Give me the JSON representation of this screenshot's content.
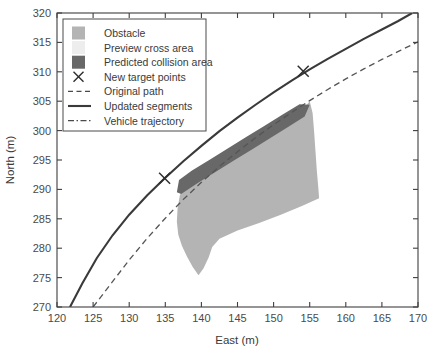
{
  "chart_data": {
    "type": "scatter",
    "title": "",
    "xlabel": "East (m)",
    "ylabel": "North (m)",
    "xlim": [
      120,
      170
    ],
    "ylim": [
      270,
      320
    ],
    "xticks": [
      120,
      125,
      130,
      135,
      140,
      145,
      150,
      155,
      160,
      165,
      170
    ],
    "yticks": [
      270,
      275,
      280,
      285,
      290,
      295,
      300,
      305,
      310,
      315,
      320
    ],
    "grid": false,
    "legend_position": "upper-left",
    "legend": [
      {
        "label": "Obstacle",
        "type": "patch",
        "color": "#b4b4b4"
      },
      {
        "label": "Preview cross area",
        "type": "patch",
        "color": "#ededed"
      },
      {
        "label": "Predicted collision area",
        "type": "patch",
        "color": "#686868"
      },
      {
        "label": "New target points",
        "type": "marker",
        "marker": "x",
        "color": "#2e2e2e"
      },
      {
        "label": "Original path",
        "type": "line",
        "style": "dashed",
        "color": "#4a4a4a"
      },
      {
        "label": "Updated segments",
        "type": "line",
        "style": "solid",
        "color": "#3a3a3a"
      },
      {
        "label": "Vehicle trajectory",
        "type": "line",
        "style": "dashdot",
        "color": "#4a4a4a"
      }
    ],
    "series": [
      {
        "name": "Obstacle",
        "type": "polygon",
        "color": "#b4b4b4",
        "points": [
          [
            137.0,
            288.9
          ],
          [
            137.6,
            290.8
          ],
          [
            139.2,
            292.6
          ],
          [
            141.0,
            294.1
          ],
          [
            143.3,
            295.8
          ],
          [
            145.6,
            297.4
          ],
          [
            148.0,
            299.0
          ],
          [
            150.3,
            300.7
          ],
          [
            152.6,
            302.4
          ],
          [
            154.2,
            303.8
          ],
          [
            155.0,
            305.0
          ],
          [
            155.4,
            303.0
          ],
          [
            155.6,
            300.0
          ],
          [
            155.8,
            296.5
          ],
          [
            156.0,
            293.0
          ],
          [
            156.2,
            290.2
          ],
          [
            156.3,
            288.5
          ],
          [
            154.0,
            287.2
          ],
          [
            151.0,
            285.7
          ],
          [
            148.0,
            284.3
          ],
          [
            145.0,
            283.0
          ],
          [
            142.5,
            281.6
          ],
          [
            141.5,
            280.2
          ],
          [
            141.0,
            278.4
          ],
          [
            140.3,
            276.6
          ],
          [
            139.6,
            275.4
          ],
          [
            138.8,
            276.8
          ],
          [
            138.0,
            278.6
          ],
          [
            137.3,
            280.4
          ],
          [
            136.8,
            282.3
          ],
          [
            136.6,
            284.5
          ],
          [
            136.7,
            286.7
          ]
        ]
      },
      {
        "name": "Predicted collision area",
        "type": "polygon",
        "color": "#686868",
        "points": [
          [
            137.2,
            289.2
          ],
          [
            139.5,
            291.1
          ],
          [
            142.0,
            293.0
          ],
          [
            144.5,
            294.9
          ],
          [
            147.0,
            296.8
          ],
          [
            149.5,
            298.7
          ],
          [
            152.0,
            300.6
          ],
          [
            154.3,
            302.4
          ],
          [
            155.0,
            304.4
          ],
          [
            153.6,
            304.5
          ],
          [
            151.2,
            302.7
          ],
          [
            148.7,
            300.8
          ],
          [
            146.2,
            298.9
          ],
          [
            143.7,
            297.0
          ],
          [
            141.2,
            295.1
          ],
          [
            138.7,
            293.2
          ],
          [
            136.9,
            291.6
          ],
          [
            136.6,
            289.5
          ]
        ]
      },
      {
        "name": "Original path",
        "type": "line",
        "style": "dashed",
        "color": "#555555",
        "points": [
          [
            125.0,
            270.0
          ],
          [
            127.5,
            274.0
          ],
          [
            130.0,
            278.0
          ],
          [
            132.5,
            281.7
          ],
          [
            135.0,
            285.1
          ],
          [
            137.5,
            288.3
          ],
          [
            140.0,
            291.2
          ],
          [
            142.5,
            293.9
          ],
          [
            145.0,
            296.4
          ],
          [
            147.5,
            298.8
          ],
          [
            150.0,
            301.0
          ],
          [
            152.5,
            303.1
          ],
          [
            155.0,
            305.1
          ],
          [
            157.5,
            307.0
          ],
          [
            160.0,
            308.8
          ],
          [
            162.5,
            310.5
          ],
          [
            165.0,
            312.1
          ],
          [
            167.5,
            313.6
          ],
          [
            170.0,
            315.1
          ]
        ]
      },
      {
        "name": "Updated segments",
        "type": "line",
        "style": "solid",
        "color": "#3a3a3a",
        "points": [
          [
            121.8,
            270.0
          ],
          [
            123.5,
            274.0
          ],
          [
            125.5,
            278.3
          ],
          [
            127.7,
            282.2
          ],
          [
            130.0,
            285.7
          ],
          [
            132.5,
            289.0
          ],
          [
            135.0,
            292.0
          ],
          [
            137.5,
            294.8
          ],
          [
            140.0,
            297.4
          ],
          [
            142.5,
            299.9
          ],
          [
            145.0,
            302.2
          ],
          [
            147.5,
            304.4
          ],
          [
            150.0,
            306.5
          ],
          [
            152.5,
            308.5
          ],
          [
            155.0,
            310.4
          ],
          [
            157.5,
            312.2
          ],
          [
            160.0,
            313.9
          ],
          [
            162.5,
            315.6
          ],
          [
            165.0,
            317.2
          ],
          [
            167.2,
            318.6
          ],
          [
            169.2,
            320.0
          ]
        ]
      },
      {
        "name": "New target points",
        "type": "marker",
        "marker": "x",
        "color": "#2e2e2e",
        "points": [
          [
            134.9,
            291.9
          ],
          [
            154.1,
            310.1
          ]
        ]
      }
    ]
  }
}
